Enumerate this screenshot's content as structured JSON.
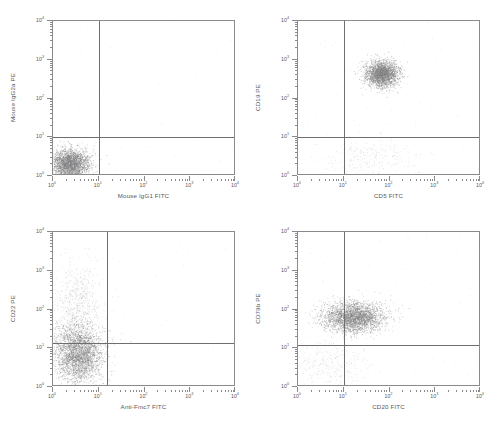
{
  "figure": {
    "type": "flow-cytometry-dot-plot-grid",
    "rows": 2,
    "columns": 2,
    "background_color": "#ffffff",
    "dot_color": "#808082",
    "axis_color": "#8a8a8c",
    "gate_color": "#6e6e70",
    "text_color": "#58585a"
  },
  "axis_ticks": {
    "labels": [
      "10",
      "10",
      "10",
      "10",
      "10"
    ],
    "exponents": [
      "0",
      "1",
      "2",
      "3",
      "4"
    ],
    "decades": 4,
    "scale": "log"
  },
  "chart_data": [
    {
      "id": "panel-top-left",
      "type": "scatter",
      "title": "",
      "xlabel": "Mouse IgG1 FITC",
      "ylabel": "Mouse IgG2a PE",
      "xlim": [
        1,
        10000
      ],
      "ylim": [
        1,
        10000
      ],
      "xscale": "log",
      "yscale": "log",
      "grid": false,
      "legend": "none",
      "gates": {
        "x": 10,
        "y": 10
      },
      "quadrant_fractions": {
        "lower_left": 0.995,
        "lower_right": 0.004,
        "upper_left": 0.001,
        "upper_right": 0.0
      },
      "clusters": [
        {
          "name": "isotype-control-negative",
          "cx_log": 0.38,
          "cy_log": 0.26,
          "sx_log": 0.21,
          "sy_log": 0.2,
          "n": 2600,
          "opacity": 0.62
        }
      ],
      "noise": {
        "n": 60,
        "opacity": 0.18
      }
    },
    {
      "id": "panel-top-right",
      "type": "scatter",
      "title": "",
      "xlabel": "CD5 FITC",
      "ylabel": "CD19 PE",
      "xlim": [
        1,
        10000
      ],
      "ylim": [
        1,
        10000
      ],
      "xscale": "log",
      "yscale": "log",
      "grid": false,
      "legend": "none",
      "gates": {
        "x": 10,
        "y": 10
      },
      "quadrant_fractions": {
        "lower_left": 0.06,
        "lower_right": 0.05,
        "upper_left": 0.01,
        "upper_right": 0.88
      },
      "clusters": [
        {
          "name": "cd5-cd19-double-positive",
          "cx_log": 1.86,
          "cy_log": 2.62,
          "sx_log": 0.18,
          "sy_log": 0.17,
          "n": 2300,
          "opacity": 0.62
        },
        {
          "name": "double-negative-debris",
          "cx_log": 1.6,
          "cy_log": 0.45,
          "sx_log": 0.55,
          "sy_log": 0.3,
          "n": 260,
          "opacity": 0.3
        }
      ],
      "noise": {
        "n": 150,
        "opacity": 0.18
      }
    },
    {
      "id": "panel-bottom-left",
      "type": "scatter",
      "title": "",
      "xlabel": "Anti-Fmc7 FITC",
      "ylabel": "CD22 PE",
      "xlim": [
        1,
        10000
      ],
      "ylim": [
        1,
        10000
      ],
      "xscale": "log",
      "yscale": "log",
      "grid": false,
      "legend": "none",
      "gates": {
        "x": 15,
        "y": 14
      },
      "quadrant_fractions": {
        "lower_left": 0.78,
        "lower_right": 0.01,
        "upper_left": 0.21,
        "upper_right": 0.0
      },
      "clusters": [
        {
          "name": "cd22-dim-fmc7-negative",
          "cx_log": 0.55,
          "cy_log": 0.82,
          "sx_log": 0.27,
          "sy_log": 0.38,
          "n": 3000,
          "opacity": 0.6
        },
        {
          "name": "cd22-bright-tail",
          "cx_log": 0.55,
          "cy_log": 2.1,
          "sx_log": 0.26,
          "sy_log": 0.55,
          "n": 700,
          "opacity": 0.3
        }
      ],
      "noise": {
        "n": 130,
        "opacity": 0.16
      }
    },
    {
      "id": "panel-bottom-right",
      "type": "scatter",
      "title": "",
      "xlabel": "CD20 FITC",
      "ylabel": "CD79b PE",
      "xlim": [
        1,
        10000
      ],
      "ylim": [
        1,
        10000
      ],
      "xscale": "log",
      "yscale": "log",
      "grid": false,
      "legend": "none",
      "gates": {
        "x": 10,
        "y": 12
      },
      "quadrant_fractions": {
        "lower_left": 0.08,
        "lower_right": 0.05,
        "upper_left": 0.22,
        "upper_right": 0.65
      },
      "clusters": [
        {
          "name": "cd20-cd79b-positive",
          "cx_log": 1.25,
          "cy_log": 1.78,
          "sx_log": 0.33,
          "sy_log": 0.2,
          "n": 2800,
          "opacity": 0.6
        },
        {
          "name": "low-expression-debris",
          "cx_log": 0.75,
          "cy_log": 0.55,
          "sx_log": 0.45,
          "sy_log": 0.3,
          "n": 300,
          "opacity": 0.28
        }
      ],
      "noise": {
        "n": 160,
        "opacity": 0.16
      }
    }
  ],
  "panels": [
    {
      "position": "top-left",
      "xlabel": "Mouse IgG1 FITC",
      "ylabel": "Mouse IgG2a PE"
    },
    {
      "position": "top-right",
      "xlabel": "CD5 FITC",
      "ylabel": "CD19 PE"
    },
    {
      "position": "bottom-left",
      "xlabel": "Anti-Fmc7 FITC",
      "ylabel": "CD22 PE"
    },
    {
      "position": "bottom-right",
      "xlabel": "CD20 FITC",
      "ylabel": "CD79b PE"
    }
  ]
}
